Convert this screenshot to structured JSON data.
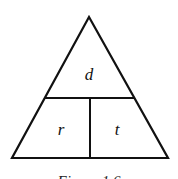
{
  "diagram": {
    "type": "formula-triangle",
    "top_label": "d",
    "bottom_left_label": "r",
    "bottom_right_label": "t",
    "caption": "Figure 1.6",
    "stroke_color": "#111111",
    "background": "#ffffff"
  }
}
